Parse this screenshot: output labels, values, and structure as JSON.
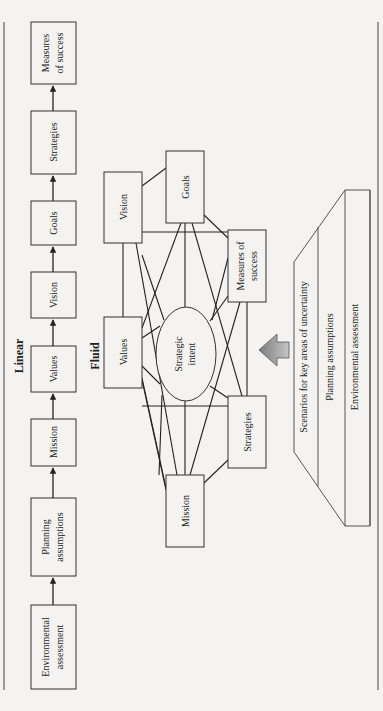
{
  "linear": {
    "title": "Linear",
    "steps": [
      {
        "line1": "Environmental",
        "line2": "assessment"
      },
      {
        "line1": "Planning",
        "line2": "assumptions"
      },
      {
        "line1": "Mission",
        "line2": ""
      },
      {
        "line1": "Values",
        "line2": ""
      },
      {
        "line1": "Vision",
        "line2": ""
      },
      {
        "line1": "Goals",
        "line2": ""
      },
      {
        "line1": "Strategies",
        "line2": ""
      },
      {
        "line1": "Measures",
        "line2": "of success"
      }
    ]
  },
  "fluid": {
    "title": "Fluid",
    "center": {
      "line1": "Strategic",
      "line2": "intent"
    },
    "nodes": {
      "values": {
        "line1": "Values",
        "line2": ""
      },
      "vision": {
        "line1": "Vision",
        "line2": ""
      },
      "goals": {
        "line1": "Goals",
        "line2": ""
      },
      "measures": {
        "line1": "Measures of",
        "line2": "success"
      },
      "strategies": {
        "line1": "Strategies",
        "line2": ""
      },
      "mission": {
        "line1": "Mission",
        "line2": ""
      }
    }
  },
  "foundation": {
    "layers": [
      "Scenarios for key areas of uncertainty",
      "Planning assumptions",
      "Environmental assessment"
    ]
  },
  "colors": {
    "background": "#f4f3f1",
    "ink": "#222222",
    "arrow_fill": "#9a9a9a"
  }
}
